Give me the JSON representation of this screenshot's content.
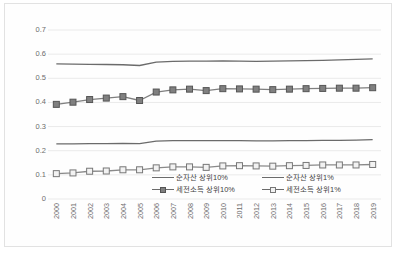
{
  "chart_data": {
    "type": "line",
    "title": "",
    "xlabel": "",
    "ylabel": "",
    "ylim": [
      0,
      0.7
    ],
    "ytick_labels": [
      "0.7",
      "0.6",
      "0.5",
      "0.4",
      "0.3",
      "0.2",
      "0.1",
      "0"
    ],
    "ytick_values": [
      0.7,
      0.6,
      0.5,
      0.4,
      0.3,
      0.2,
      0.1,
      0
    ],
    "grid": true,
    "legend_position": "inside-bottom",
    "categories": [
      "2000",
      "2001",
      "2002",
      "2003",
      "2004",
      "2005",
      "2006",
      "2007",
      "2008",
      "2009",
      "2010",
      "2011",
      "2012",
      "2013",
      "2014",
      "2015",
      "2016",
      "2017",
      "2018",
      "2019"
    ],
    "series": [
      {
        "name": "순자산 상위10%",
        "marker": "none",
        "color": "#6b6b6b",
        "values": [
          0.56,
          0.559,
          0.558,
          0.557,
          0.556,
          0.553,
          0.567,
          0.57,
          0.571,
          0.571,
          0.572,
          0.571,
          0.57,
          0.571,
          0.572,
          0.573,
          0.574,
          0.576,
          0.578,
          0.58
        ]
      },
      {
        "name": "세전소득 상위10%",
        "marker": "square-filled",
        "color": "#7f7f7f",
        "values": [
          0.392,
          0.401,
          0.412,
          0.418,
          0.424,
          0.408,
          0.443,
          0.452,
          0.455,
          0.449,
          0.457,
          0.456,
          0.455,
          0.453,
          0.455,
          0.457,
          0.458,
          0.459,
          0.459,
          0.461
        ]
      },
      {
        "name": "순자산 상위1%",
        "marker": "none",
        "color": "#6b6b6b",
        "values": [
          0.228,
          0.228,
          0.229,
          0.229,
          0.23,
          0.229,
          0.24,
          0.242,
          0.242,
          0.242,
          0.242,
          0.242,
          0.241,
          0.241,
          0.242,
          0.242,
          0.243,
          0.243,
          0.244,
          0.246
        ]
      },
      {
        "name": "세전소득 상위1%",
        "marker": "square-hollow",
        "color": "#8a8a8a",
        "values": [
          0.105,
          0.108,
          0.115,
          0.116,
          0.121,
          0.121,
          0.129,
          0.133,
          0.133,
          0.131,
          0.137,
          0.138,
          0.137,
          0.136,
          0.138,
          0.139,
          0.141,
          0.141,
          0.141,
          0.143
        ]
      }
    ]
  },
  "legend": {
    "items": [
      {
        "label": "순자산 상위10%",
        "marker": "none"
      },
      {
        "label": "순자산 상위1%",
        "marker": "none"
      },
      {
        "label": "세전소득 상위10%",
        "marker": "square-filled"
      },
      {
        "label": "세전소득 상위1%",
        "marker": "square-hollow"
      }
    ]
  },
  "colors": {
    "line": "#6b6b6b",
    "grid": "#eaeaea",
    "axis_text": "#6d6d6d",
    "frame": "#e2e2e2",
    "marker_fill": "#808080",
    "marker_hollow_fill": "#f2f2f2"
  }
}
